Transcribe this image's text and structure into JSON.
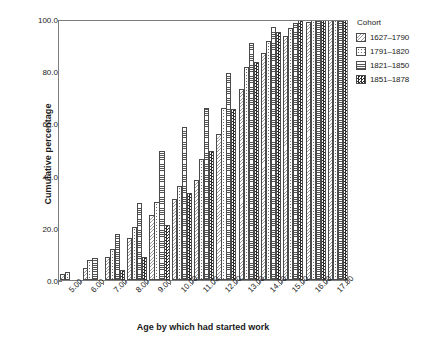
{
  "chart_data": {
    "type": "bar",
    "title": "",
    "xlabel": "Age by which had started work",
    "ylabel": "Cumulative percentage",
    "ylim": [
      0,
      100
    ],
    "yticks": [
      "0.0",
      "20.0",
      "40.0",
      "60.0",
      "80.0",
      "100.0"
    ],
    "ytick_values": [
      0,
      20,
      40,
      60,
      80,
      100
    ],
    "grid": false,
    "legend_position": "right",
    "legend_title": "Cohort",
    "categories": [
      "5.00",
      "6.00",
      "7.00",
      "8.00",
      "9.00",
      "10.00",
      "11.00",
      "12.00",
      "13.00",
      "14.00",
      "15.00",
      "16.00",
      "17.00"
    ],
    "series": [
      {
        "name": "1627–1790",
        "pattern": "diagonal-hatch",
        "values": [
          2.2,
          4.5,
          9.0,
          16.0,
          25.0,
          31.0,
          38.5,
          56.0,
          73.0,
          87.0,
          93.5,
          99.0,
          100.0
        ]
      },
      {
        "name": "1791–1820",
        "pattern": "sparse-dots",
        "values": [
          3.0,
          7.5,
          12.0,
          20.5,
          30.0,
          36.0,
          46.5,
          66.0,
          81.5,
          91.5,
          96.5,
          99.5,
          100.0
        ]
      },
      {
        "name": "1821–1850",
        "pattern": "horizontal-lines",
        "values": [
          0.0,
          8.5,
          17.5,
          29.5,
          49.5,
          58.5,
          66.0,
          79.5,
          91.0,
          97.0,
          98.5,
          100.0,
          100.0
        ]
      },
      {
        "name": "1851–1878",
        "pattern": "checkerboard",
        "values": [
          0.0,
          0.0,
          4.0,
          9.0,
          21.0,
          33.5,
          49.5,
          65.5,
          83.5,
          95.0,
          99.5,
          100.0,
          100.0
        ]
      }
    ]
  }
}
